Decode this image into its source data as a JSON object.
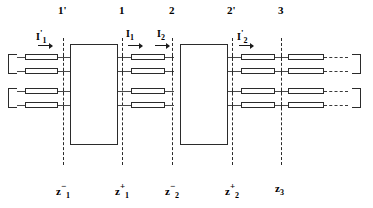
{
  "figure": {
    "kind": "cascaded-network-reference-plane-schematic",
    "background_color": "#ffffff",
    "line_color": "#2b2b2b",
    "text_color": "#000000"
  },
  "reference_planes": [
    {
      "id": "p1prime",
      "name": "1'",
      "x": 63,
      "z_base": "z",
      "z_sub": "1",
      "z_sup": "−"
    },
    {
      "id": "p1",
      "name": "1",
      "x": 122,
      "z_base": "z",
      "z_sub": "1",
      "z_sup": "+"
    },
    {
      "id": "p2",
      "name": "2",
      "x": 172,
      "z_base": "z",
      "z_sub": "2",
      "z_sup": "−"
    },
    {
      "id": "p2prime",
      "name": "2'",
      "x": 232,
      "z_base": "z",
      "z_sub": "2",
      "z_sup": "+"
    },
    {
      "id": "p3",
      "name": "3",
      "x": 281,
      "z_base": "z",
      "z_sub": "3",
      "z_sup": ""
    }
  ],
  "currents": [
    {
      "id": "i1prime",
      "base": "I",
      "sub": "1",
      "prime": "'",
      "x": 36,
      "y": 30
    },
    {
      "id": "i1",
      "base": "I",
      "sub": "1",
      "prime": "",
      "x": 126,
      "y": 30
    },
    {
      "id": "i2",
      "base": "I",
      "sub": "2",
      "prime": "",
      "x": 157,
      "y": 30
    },
    {
      "id": "i2prime",
      "base": "I",
      "sub": "2",
      "prime": "'",
      "x": 237,
      "y": 30
    }
  ],
  "networks": [
    {
      "id": "network-a",
      "x": 70,
      "y": 44,
      "w": 48,
      "h": 101
    },
    {
      "id": "network-b",
      "x": 180,
      "y": 44,
      "w": 48,
      "h": 101
    }
  ],
  "conductor_rows": [
    {
      "id": "row-1",
      "y": 57
    },
    {
      "id": "row-2",
      "y": 71
    },
    {
      "id": "row-3",
      "y": 91
    },
    {
      "id": "row-4",
      "y": 105
    }
  ],
  "terminators": {
    "left": [
      {
        "id": "left-port-upper",
        "x": 8,
        "y": 57,
        "h": 14
      },
      {
        "id": "left-port-lower",
        "x": 8,
        "y": 91,
        "h": 14
      }
    ],
    "right": [
      {
        "id": "right-port-upper",
        "x": 352,
        "y": 57,
        "h": 14
      },
      {
        "id": "right-port-lower",
        "x": 352,
        "y": 91,
        "h": 14
      }
    ]
  }
}
